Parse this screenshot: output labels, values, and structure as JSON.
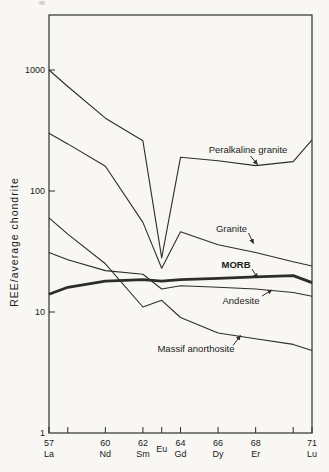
{
  "figure": {
    "background_color": "#f8f7f3",
    "line_color": "#2e2d2b",
    "text_color": "#1b1b1b"
  },
  "chart_data": {
    "type": "line",
    "title": "",
    "xlabel": "",
    "ylabel": "REE/average chondrite",
    "y_scale": "log",
    "ylim": [
      1,
      2800
    ],
    "xlim": [
      57,
      71
    ],
    "grid": false,
    "legend_position": "inline-annotations",
    "y_ticks": [
      {
        "value": 1,
        "label": "1"
      },
      {
        "value": 10,
        "label": "10"
      },
      {
        "value": 100,
        "label": "100"
      },
      {
        "value": 1000,
        "label": "1000"
      }
    ],
    "x_ticks": [
      {
        "z": 57,
        "number": "57",
        "element": "La"
      },
      {
        "z": 58,
        "number": "",
        "element": ""
      },
      {
        "z": 60,
        "number": "60",
        "element": "Nd"
      },
      {
        "z": 62,
        "number": "62",
        "element": "Sm"
      },
      {
        "z": 63,
        "number": "",
        "element": "Eu"
      },
      {
        "z": 64,
        "number": "64",
        "element": "Gd"
      },
      {
        "z": 66,
        "number": "66",
        "element": "Dy"
      },
      {
        "z": 68,
        "number": "68",
        "element": "Er"
      },
      {
        "z": 70,
        "number": "",
        "element": ""
      },
      {
        "z": 71,
        "number": "71",
        "element": "Lu"
      }
    ],
    "x": [
      57,
      58,
      60,
      62,
      63,
      64,
      66,
      68,
      70,
      71
    ],
    "x_elements": [
      "La",
      "Ce",
      "Nd",
      "Sm",
      "Eu",
      "Gd",
      "Dy",
      "Er",
      "Yb",
      "Lu"
    ],
    "series": [
      {
        "name": "Peralkaline granite",
        "thick": false,
        "values": [
          1000,
          730,
          400,
          260,
          28,
          190,
          178,
          162,
          175,
          265
        ]
      },
      {
        "name": "Granite",
        "thick": false,
        "values": [
          300,
          245,
          160,
          55,
          23,
          46,
          36,
          31,
          26,
          24
        ]
      },
      {
        "name": "MORB",
        "thick": true,
        "values": [
          14,
          16,
          18,
          18.5,
          18,
          18.5,
          19,
          19.5,
          20,
          17.5
        ]
      },
      {
        "name": "Andesite",
        "thick": false,
        "values": [
          31,
          27,
          22,
          20.5,
          15.5,
          16.5,
          16,
          15.5,
          14.5,
          13.5
        ]
      },
      {
        "name": "Massif anorthosite",
        "thick": false,
        "values": [
          60,
          44,
          25,
          11,
          12.5,
          9,
          6.7,
          6,
          5.4,
          4.8
        ]
      }
    ],
    "annotations": [
      {
        "text": "Peralkaline granite",
        "bold": false,
        "cx": 248,
        "cy": 150,
        "arrow": [
          250.5,
          156,
          257.5,
          164.5
        ]
      },
      {
        "text": "Granite",
        "bold": false,
        "cx": 231.5,
        "cy": 228.5,
        "arrow": [
          248.5,
          233,
          253.5,
          243.5
        ]
      },
      {
        "text": "MORB",
        "bold": true,
        "cx": 236,
        "cy": 264.5,
        "arrow": [
          252,
          269,
          257.5,
          278
        ]
      },
      {
        "text": "Andesite",
        "bold": false,
        "cx": 241,
        "cy": 300.5,
        "arrow": [
          262,
          296,
          272,
          290
        ]
      },
      {
        "text": "Massif anorthosite",
        "bold": false,
        "cx": 196,
        "cy": 349,
        "arrow": [
          233,
          345.5,
          240.5,
          335.5
        ]
      }
    ]
  }
}
